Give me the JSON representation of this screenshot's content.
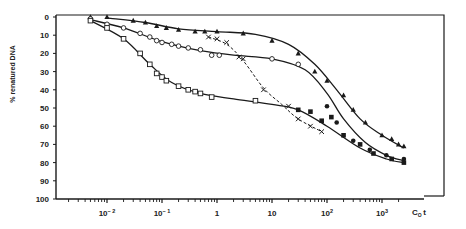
{
  "chart_data": {
    "type": "scatter",
    "title": "",
    "xlabel": "C0t",
    "xlabel_main": "C",
    "xlabel_sub": "O",
    "xlabel_suffix": "t",
    "ylabel": "% renatured DNA",
    "xscale": "log",
    "xlim": [
      0.0005,
      4000
    ],
    "ylim": [
      0,
      100
    ],
    "y_inverted": true,
    "grid": false,
    "legend": null,
    "x_ticks": [
      {
        "value": 0.01,
        "base": "10",
        "exp": "-2"
      },
      {
        "value": 0.1,
        "base": "10",
        "exp": "-1"
      },
      {
        "value": 1,
        "base": "1",
        "exp": ""
      },
      {
        "value": 10,
        "base": "10",
        "exp": ""
      },
      {
        "value": 100,
        "base": "10",
        "exp": "2"
      },
      {
        "value": 1000,
        "base": "10",
        "exp": "3"
      }
    ],
    "y_ticks": [
      0,
      10,
      20,
      30,
      40,
      50,
      60,
      70,
      80,
      90,
      100
    ],
    "series": [
      {
        "name": "filled triangles",
        "marker": "triangle-filled",
        "line": "solid",
        "points": [
          [
            0.005,
            0
          ],
          [
            0.01,
            0
          ],
          [
            0.03,
            2
          ],
          [
            0.05,
            3
          ],
          [
            0.08,
            5
          ],
          [
            0.12,
            6
          ],
          [
            0.2,
            7
          ],
          [
            0.4,
            8
          ],
          [
            0.6,
            8
          ],
          [
            1.0,
            8
          ],
          [
            3,
            9
          ],
          [
            10,
            13
          ],
          [
            30,
            20
          ],
          [
            60,
            30
          ],
          [
            100,
            35
          ],
          [
            200,
            43
          ],
          [
            300,
            51
          ],
          [
            500,
            58
          ],
          [
            1000,
            65
          ],
          [
            1500,
            67
          ],
          [
            2000,
            70
          ],
          [
            2500,
            71
          ]
        ]
      },
      {
        "name": "open circles",
        "marker": "circle-open",
        "line": "solid",
        "points": [
          [
            0.005,
            1
          ],
          [
            0.01,
            4
          ],
          [
            0.02,
            6
          ],
          [
            0.04,
            9
          ],
          [
            0.06,
            11
          ],
          [
            0.08,
            13
          ],
          [
            0.1,
            14
          ],
          [
            0.15,
            15
          ],
          [
            0.2,
            16
          ],
          [
            0.3,
            17
          ],
          [
            0.5,
            18
          ],
          [
            0.8,
            21
          ],
          [
            1.1,
            21
          ],
          [
            10,
            23
          ],
          [
            30,
            26
          ]
        ]
      },
      {
        "name": "filled circles",
        "marker": "circle-filled",
        "line": "solid",
        "points": [
          [
            100,
            49
          ],
          [
            150,
            58
          ],
          [
            300,
            68
          ],
          [
            600,
            73
          ],
          [
            1200,
            76
          ],
          [
            2500,
            78
          ]
        ]
      },
      {
        "name": "open squares",
        "marker": "square-open",
        "line": "solid",
        "points": [
          [
            0.005,
            2
          ],
          [
            0.01,
            6
          ],
          [
            0.02,
            12
          ],
          [
            0.04,
            20
          ],
          [
            0.06,
            26
          ],
          [
            0.08,
            31
          ],
          [
            0.1,
            33
          ],
          [
            0.12,
            35
          ],
          [
            0.2,
            38
          ],
          [
            0.3,
            40
          ],
          [
            0.4,
            41
          ],
          [
            0.5,
            42
          ],
          [
            0.8,
            44
          ],
          [
            5,
            46
          ]
        ]
      },
      {
        "name": "filled squares",
        "marker": "square-filled",
        "line": "solid",
        "points": [
          [
            30,
            51
          ],
          [
            50,
            52
          ],
          [
            80,
            57
          ],
          [
            120,
            55
          ],
          [
            200,
            65
          ],
          [
            400,
            70
          ],
          [
            700,
            75
          ],
          [
            1500,
            78
          ],
          [
            2500,
            80
          ]
        ]
      },
      {
        "name": "crosses",
        "marker": "x",
        "line": "dashed",
        "points": [
          [
            0.7,
            11
          ],
          [
            1.0,
            12
          ],
          [
            1.5,
            14
          ],
          [
            2.5,
            22
          ],
          [
            3,
            23
          ],
          [
            7,
            40
          ],
          [
            20,
            49
          ],
          [
            30,
            56
          ],
          [
            50,
            60
          ],
          [
            80,
            63
          ]
        ]
      }
    ],
    "curves": [
      {
        "name": "upper curve (triangles)",
        "line": "solid",
        "points": [
          [
            0.001,
            0
          ],
          [
            0.01,
            0.5
          ],
          [
            0.05,
            3
          ],
          [
            0.2,
            6.5
          ],
          [
            1,
            8
          ],
          [
            5,
            9.5
          ],
          [
            20,
            15
          ],
          [
            60,
            26
          ],
          [
            150,
            40
          ],
          [
            400,
            56
          ],
          [
            1000,
            65
          ],
          [
            2500,
            72
          ]
        ]
      },
      {
        "name": "middle curve (circles)",
        "line": "solid",
        "points": [
          [
            0.001,
            0
          ],
          [
            0.005,
            1.5
          ],
          [
            0.02,
            6
          ],
          [
            0.1,
            13.5
          ],
          [
            0.5,
            18.5
          ],
          [
            2,
            21
          ],
          [
            10,
            23
          ],
          [
            40,
            29
          ],
          [
            100,
            42
          ],
          [
            200,
            56
          ],
          [
            500,
            69
          ],
          [
            1200,
            76
          ],
          [
            2500,
            79
          ]
        ]
      },
      {
        "name": "lower curve (squares)",
        "line": "solid",
        "points": [
          [
            0.001,
            0
          ],
          [
            0.005,
            2
          ],
          [
            0.02,
            12
          ],
          [
            0.06,
            26
          ],
          [
            0.15,
            36
          ],
          [
            0.5,
            42
          ],
          [
            2,
            45
          ],
          [
            10,
            48
          ],
          [
            30,
            51
          ],
          [
            100,
            60
          ],
          [
            400,
            72
          ],
          [
            1200,
            78
          ],
          [
            2500,
            80
          ]
        ]
      },
      {
        "name": "dashed curve (crosses)",
        "line": "dashed",
        "points": [
          [
            0.7,
            11
          ],
          [
            1.5,
            15
          ],
          [
            3,
            24
          ],
          [
            7,
            39
          ],
          [
            15,
            48
          ],
          [
            30,
            56
          ],
          [
            80,
            63
          ]
        ]
      }
    ]
  },
  "axes": {
    "ylabel": "% renatured DNA",
    "xlabel_main": "C",
    "xlabel_sub": "O",
    "xlabel_suffix": "t"
  }
}
